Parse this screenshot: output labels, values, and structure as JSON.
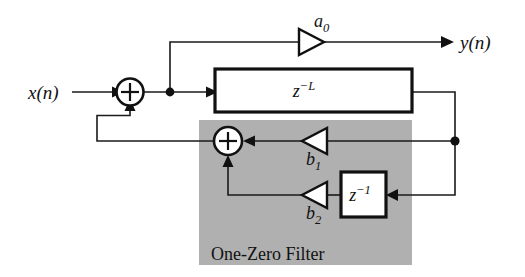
{
  "figure": {
    "kind": "signal-flow-block-diagram",
    "title_caption": "One-Zero Filter",
    "background_color": "#ffffff",
    "line_color": "#111111",
    "shaded_region_color": "#b0b0b0"
  },
  "signals": {
    "input_label": "x(n)",
    "output_label": "y(n)"
  },
  "blocks": [
    {
      "id": "delay-line",
      "label_base": "z",
      "label_exponent": "−L",
      "label_text": "z−L",
      "x": 215,
      "y": 69,
      "width": 197,
      "height": 43
    },
    {
      "id": "unit-delay",
      "label_base": "z",
      "label_exponent": "−1",
      "label_text": "z−1",
      "x": 341,
      "y": 172,
      "width": 45,
      "height": 45
    }
  ],
  "gains": [
    {
      "id": "gain-a0",
      "label_base": "a",
      "label_subscript": "0",
      "label_text": "a0",
      "direction": "right",
      "cx": 311,
      "cy": 42
    },
    {
      "id": "gain-b1",
      "label_base": "b",
      "label_subscript": "1",
      "label_text": "b1",
      "direction": "left",
      "cx": 315,
      "cy": 141
    },
    {
      "id": "gain-b2",
      "label_base": "b",
      "label_subscript": "2",
      "label_text": "b2",
      "direction": "left",
      "cx": 315,
      "cy": 195
    }
  ],
  "adders": [
    {
      "id": "adder-input",
      "symbol": "+",
      "cx": 130,
      "cy": 92,
      "r": 13.5
    },
    {
      "id": "adder-feedback",
      "symbol": "+",
      "cx": 228,
      "cy": 141,
      "r": 14
    }
  ],
  "nodes": [
    {
      "id": "node-forward-tap",
      "cx": 170,
      "cy": 92
    },
    {
      "id": "node-delay-output-tap",
      "cx": 455,
      "cy": 141
    }
  ],
  "shaded_region": {
    "id": "one-zero-filter-region",
    "label": "One-Zero Filter",
    "x": 199,
    "y": 120,
    "width": 213,
    "height": 145,
    "label_x": 211,
    "label_y": 260
  }
}
